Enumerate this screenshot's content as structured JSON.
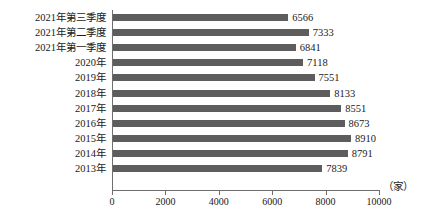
{
  "chart_data": {
    "type": "bar",
    "orientation": "horizontal",
    "title": "",
    "subtitle": "",
    "xlabel": "",
    "ylabel": "",
    "unit_label": "（家）",
    "xlim": [
      0,
      10000
    ],
    "grid": false,
    "legend": null,
    "tick_labels": [
      "0",
      "2000",
      "4000",
      "6000",
      "8000",
      "10000"
    ],
    "tick_values": [
      0,
      2000,
      4000,
      6000,
      8000,
      10000
    ],
    "categories": [
      "2021年第三季度",
      "2021年第二季度",
      "2021年第一季度",
      "2020年",
      "2019年",
      "2018年",
      "2017年",
      "2016年",
      "2015年",
      "2014年",
      "2013年"
    ],
    "values": [
      6566,
      7333,
      6841,
      7118,
      7551,
      8133,
      8551,
      8673,
      8910,
      8791,
      7839
    ],
    "value_labels": [
      "6566",
      "7333",
      "6841",
      "7118",
      "7551",
      "8133",
      "8551",
      "8673",
      "8910",
      "8791",
      "7839"
    ],
    "bar_color": "#5d5d5d",
    "axis_color": "#6e6e6e"
  }
}
